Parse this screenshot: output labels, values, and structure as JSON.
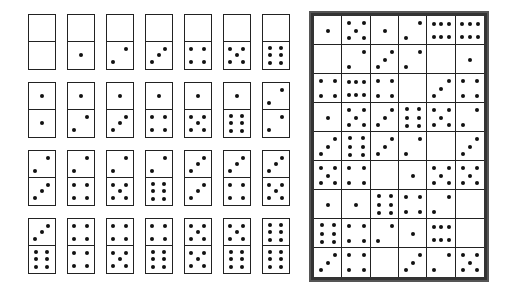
{
  "domino_set": {
    "rows": [
      [
        [
          0,
          0
        ],
        [
          0,
          1
        ],
        [
          0,
          2
        ],
        [
          0,
          3
        ],
        [
          0,
          4
        ],
        [
          0,
          5
        ],
        [
          0,
          6
        ]
      ],
      [
        [
          1,
          1
        ],
        [
          1,
          2
        ],
        [
          1,
          3
        ],
        [
          1,
          4
        ],
        [
          1,
          5
        ],
        [
          1,
          6
        ],
        [
          2,
          2
        ]
      ],
      [
        [
          2,
          3
        ],
        [
          2,
          4
        ],
        [
          2,
          5
        ],
        [
          2,
          6
        ],
        [
          3,
          3
        ],
        [
          3,
          4
        ],
        [
          3,
          5
        ]
      ],
      [
        [
          3,
          6
        ],
        [
          4,
          4
        ],
        [
          4,
          5
        ],
        [
          4,
          6
        ],
        [
          5,
          5
        ],
        [
          5,
          6
        ],
        [
          6,
          6
        ]
      ]
    ]
  },
  "puzzle_grid": {
    "columns": 6,
    "rows": 9,
    "cells": [
      [
        1,
        5,
        1,
        2,
        "6h",
        "6h"
      ],
      [
        0,
        2,
        3,
        2,
        0,
        1
      ],
      [
        4,
        "6h",
        4,
        0,
        3,
        4
      ],
      [
        1,
        5,
        3,
        "6v",
        5,
        2
      ],
      [
        3,
        "6v",
        3,
        2,
        0,
        3
      ],
      [
        5,
        4,
        0,
        1,
        5,
        5
      ],
      [
        1,
        1,
        "6v",
        4,
        2,
        0
      ],
      [
        "6v",
        4,
        2,
        1,
        "6h",
        0
      ],
      [
        3,
        4,
        0,
        3,
        2,
        5
      ]
    ]
  },
  "colors": {
    "ink": "#111111",
    "frame": "#333333",
    "background": "#ffffff"
  }
}
